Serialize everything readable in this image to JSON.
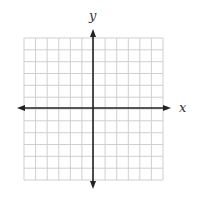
{
  "figure": {
    "type": "coordinate-plane",
    "x_axis_label": "x",
    "y_axis_label": "y",
    "grid": {
      "columns": 12,
      "rows": 12,
      "left": 24,
      "top": 38,
      "right": 163,
      "bottom": 180,
      "line_color": "#cfcfcf"
    },
    "origin": {
      "x": 93,
      "y": 108
    },
    "axis_color": "#222222",
    "x_axis_extent": [
      17,
      171
    ],
    "y_axis_extent": [
      29,
      189
    ]
  }
}
